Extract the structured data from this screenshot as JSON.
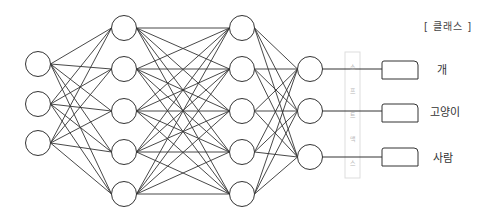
{
  "diagram": {
    "type": "neural-network",
    "header": "[ 클래스 ]",
    "layers": [
      {
        "name": "input",
        "x": 38,
        "ys": [
          64,
          104,
          143
        ]
      },
      {
        "name": "hidden-1",
        "x": 124,
        "ys": [
          28,
          69,
          111,
          152,
          194
        ]
      },
      {
        "name": "hidden-2",
        "x": 242,
        "ys": [
          28,
          69,
          111,
          152,
          194
        ]
      },
      {
        "name": "output",
        "x": 310,
        "ys": [
          69,
          111,
          157
        ]
      }
    ],
    "node_radius": 12.5,
    "softmax_layer": {
      "label_chars": [
        "소",
        "프",
        "트",
        "맥",
        "스"
      ],
      "x": 345,
      "y": 52,
      "w": 15,
      "h": 126
    },
    "classes": [
      {
        "label": "개",
        "box_y": 61,
        "line_y": 69
      },
      {
        "label": "고양이",
        "box_y": 104,
        "line_y": 111
      },
      {
        "label": "사람",
        "box_y": 148,
        "line_y": 157
      }
    ],
    "colors": {
      "stroke": "#333333",
      "softmax_box": "#dddddd",
      "text": "#333333"
    }
  }
}
